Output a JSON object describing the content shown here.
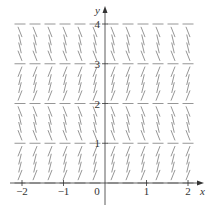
{
  "chart_data": {
    "type": "slope_field",
    "title": "",
    "xlabel": "x",
    "ylabel": "y",
    "xlim": [
      -2,
      2
    ],
    "ylim": [
      0,
      4
    ],
    "x_ticks": [
      -2,
      -1,
      0,
      1,
      2
    ],
    "x_tick_labels": [
      "−2",
      "−1",
      "0",
      "1",
      "2"
    ],
    "y_ticks": [
      1,
      2,
      3,
      4
    ],
    "y_tick_labels": [
      "1",
      "2",
      "3",
      "4"
    ],
    "grid": false,
    "equilibrium_lines_y": [
      0,
      2,
      4
    ],
    "slope_sign_by_interval": [
      {
        "y_from": 0,
        "y_to": 1,
        "sign": "positive"
      },
      {
        "y_from": 1,
        "y_to": 2,
        "sign": "negative"
      },
      {
        "y_from": 2,
        "y_to": 3,
        "sign": "positive"
      },
      {
        "y_from": 3,
        "y_to": 4,
        "sign": "negative"
      }
    ],
    "near_vertical_at_y": [
      1,
      3
    ],
    "columns_x": [
      -2,
      -1.6364,
      -1.2727,
      -0.9091,
      -0.5455,
      -0.1818,
      0.1818,
      0.5455,
      0.9091,
      1.2727,
      1.6364,
      2
    ],
    "rows_y_step": 0.2,
    "slope_dependence": "slope depends only on y (autonomous)"
  },
  "colors": {
    "axis": "#333333",
    "segment": "#8a8a8a",
    "dashed_segment": "#9a9a9a"
  }
}
